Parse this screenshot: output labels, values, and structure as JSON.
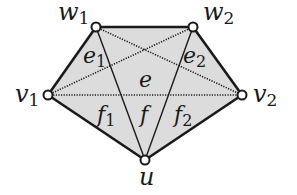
{
  "diagram": {
    "colors": {
      "fill": "#dcdcdc",
      "stroke": "#1a1a1a",
      "background": "#ffffff",
      "vertex_fill": "#ffffff"
    },
    "vertices": [
      {
        "id": "w1",
        "label": "w",
        "sub": "1",
        "x": 96,
        "y": 27,
        "lx": 58,
        "ly": 20
      },
      {
        "id": "w2",
        "label": "w",
        "sub": "2",
        "x": 193,
        "y": 27,
        "lx": 203,
        "ly": 20
      },
      {
        "id": "v1",
        "label": "v",
        "sub": "1",
        "x": 48,
        "y": 95,
        "lx": 15,
        "ly": 102
      },
      {
        "id": "v2",
        "label": "v",
        "sub": "2",
        "x": 242,
        "y": 95,
        "lx": 253,
        "ly": 102
      },
      {
        "id": "u",
        "label": "u",
        "sub": "",
        "x": 145,
        "y": 160,
        "lx": 139,
        "ly": 185
      }
    ],
    "solid_edges": [
      [
        "w1",
        "w2"
      ],
      [
        "w1",
        "v1"
      ],
      [
        "w2",
        "v2"
      ],
      [
        "v1",
        "u"
      ],
      [
        "v2",
        "u"
      ],
      [
        "w1",
        "u"
      ],
      [
        "w2",
        "u"
      ]
    ],
    "dotted_edges": [
      [
        "v1",
        "v2"
      ],
      [
        "v1",
        "w2"
      ],
      [
        "w1",
        "v2"
      ]
    ],
    "region_labels": [
      {
        "id": "e1",
        "label": "e",
        "sub": "1",
        "x": 83,
        "y": 63
      },
      {
        "id": "e2",
        "label": "e",
        "sub": "2",
        "x": 183,
        "y": 63
      },
      {
        "id": "e",
        "label": "e",
        "sub": "",
        "x": 139,
        "y": 87
      },
      {
        "id": "f1",
        "label": "f",
        "sub": "1",
        "x": 97,
        "y": 122
      },
      {
        "id": "f",
        "label": "f",
        "sub": "",
        "x": 140,
        "y": 122
      },
      {
        "id": "f2",
        "label": "f",
        "sub": "2",
        "x": 174,
        "y": 122
      }
    ]
  }
}
